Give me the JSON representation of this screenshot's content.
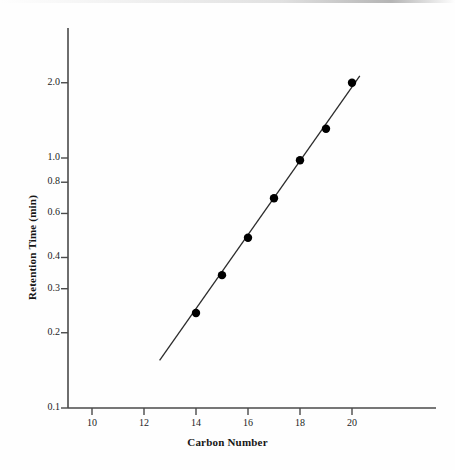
{
  "chart_data": {
    "type": "scatter",
    "title": "",
    "xlabel": "Carbon Number",
    "ylabel": "Retention Time (min)",
    "x": [
      14,
      15,
      16,
      17,
      18,
      19,
      20
    ],
    "values": [
      0.24,
      0.34,
      0.48,
      0.69,
      0.98,
      1.31,
      2.0
    ],
    "series": [
      {
        "name": "Retention time vs carbon number",
        "x": [
          14,
          15,
          16,
          17,
          18,
          19,
          20
        ],
        "values": [
          0.24,
          0.34,
          0.48,
          0.69,
          0.98,
          1.31,
          2.0
        ]
      }
    ],
    "fit_line": {
      "type": "line",
      "x": [
        12.6,
        20.3
      ],
      "values": [
        0.155,
        2.13
      ]
    },
    "xscale": "linear",
    "yscale": "log",
    "xlim": [
      8.6,
      22.0
    ],
    "ylim": [
      0.1,
      2.6
    ],
    "xticks": [
      10,
      12,
      14,
      16,
      18,
      20
    ],
    "xtick_labels": [
      "10",
      "12",
      "14",
      "16",
      "18",
      "20"
    ],
    "yticks": [
      0.1,
      0.2,
      0.3,
      0.4,
      0.6,
      0.8,
      1.0,
      2.0
    ],
    "ytick_labels": [
      "0.1",
      "0.2",
      "0.3",
      "0.4",
      "0.6",
      "0.8",
      "1.0",
      "2.0"
    ],
    "grid": false,
    "legend": "none",
    "marker": "filled-circle",
    "marker_color": "#000000",
    "line_color": "#2b2b2b",
    "axis_color": "#4a4a4a",
    "background": "#fefefe"
  },
  "axes": {
    "x_title": "Carbon Number",
    "y_title": "Retention Time (min)"
  }
}
